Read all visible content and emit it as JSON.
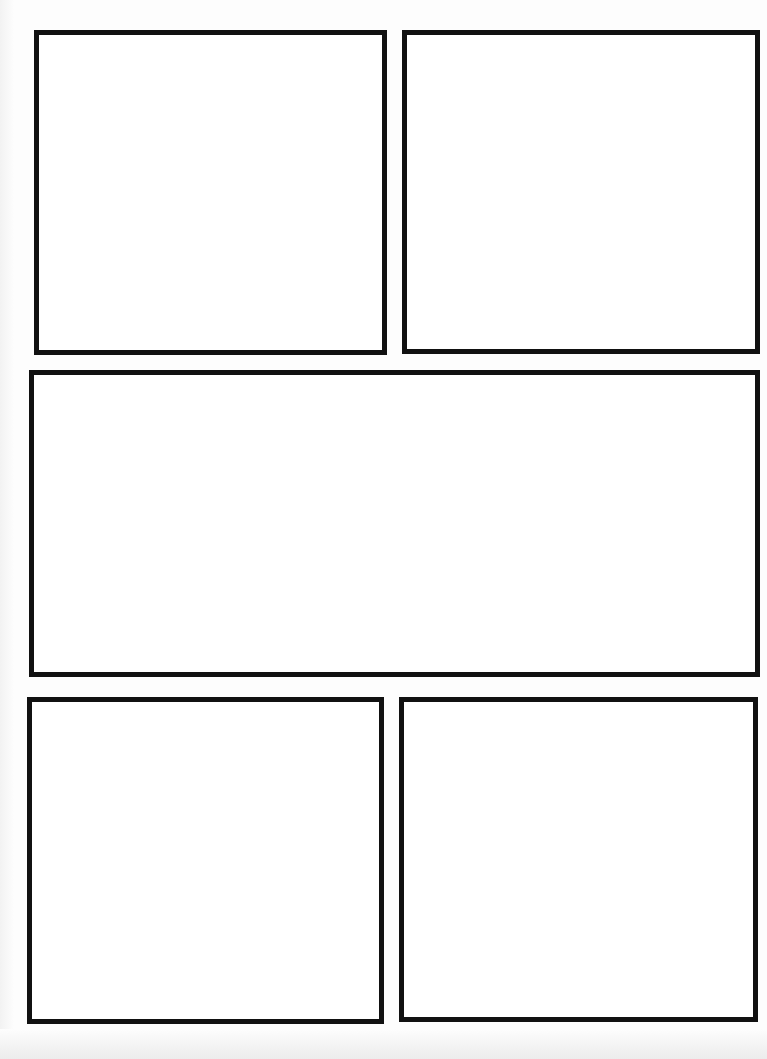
{
  "page": {
    "type": "comic-page-template",
    "background": "#fdfdfd",
    "border_color": "#111111",
    "panels": [
      {
        "id": 1,
        "label": "",
        "x": 34,
        "y": 30,
        "w": 353,
        "h": 325
      },
      {
        "id": 2,
        "label": "",
        "x": 402,
        "y": 30,
        "w": 358,
        "h": 324
      },
      {
        "id": 3,
        "label": "",
        "x": 29,
        "y": 370,
        "w": 731,
        "h": 307
      },
      {
        "id": 4,
        "label": "",
        "x": 27,
        "y": 697,
        "w": 357,
        "h": 327
      },
      {
        "id": 5,
        "label": "",
        "x": 399,
        "y": 697,
        "w": 359,
        "h": 325
      }
    ]
  }
}
